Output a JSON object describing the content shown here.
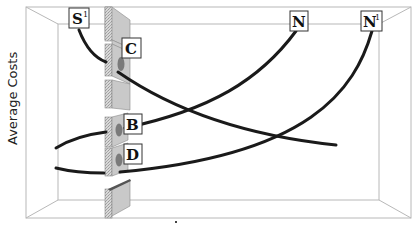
{
  "diagram": {
    "y_axis_label": "Average Costs",
    "x_axis_label": "",
    "colors": {
      "frame": "#b8b8b8",
      "curve": "#1a1a1a",
      "barrier": "#c9c9c9"
    },
    "curve_labels": [
      {
        "id": "S1",
        "text": "S",
        "sup": "1"
      },
      {
        "id": "N",
        "text": "N",
        "sup": ""
      },
      {
        "id": "N1",
        "text": "N",
        "sup": "1"
      },
      {
        "id": "C",
        "text": "C",
        "sup": ""
      },
      {
        "id": "B",
        "text": "B",
        "sup": ""
      },
      {
        "id": "D",
        "text": "D",
        "sup": ""
      }
    ],
    "barrier": {
      "description": "segmented vertical wall with openings where curves pass through"
    }
  }
}
